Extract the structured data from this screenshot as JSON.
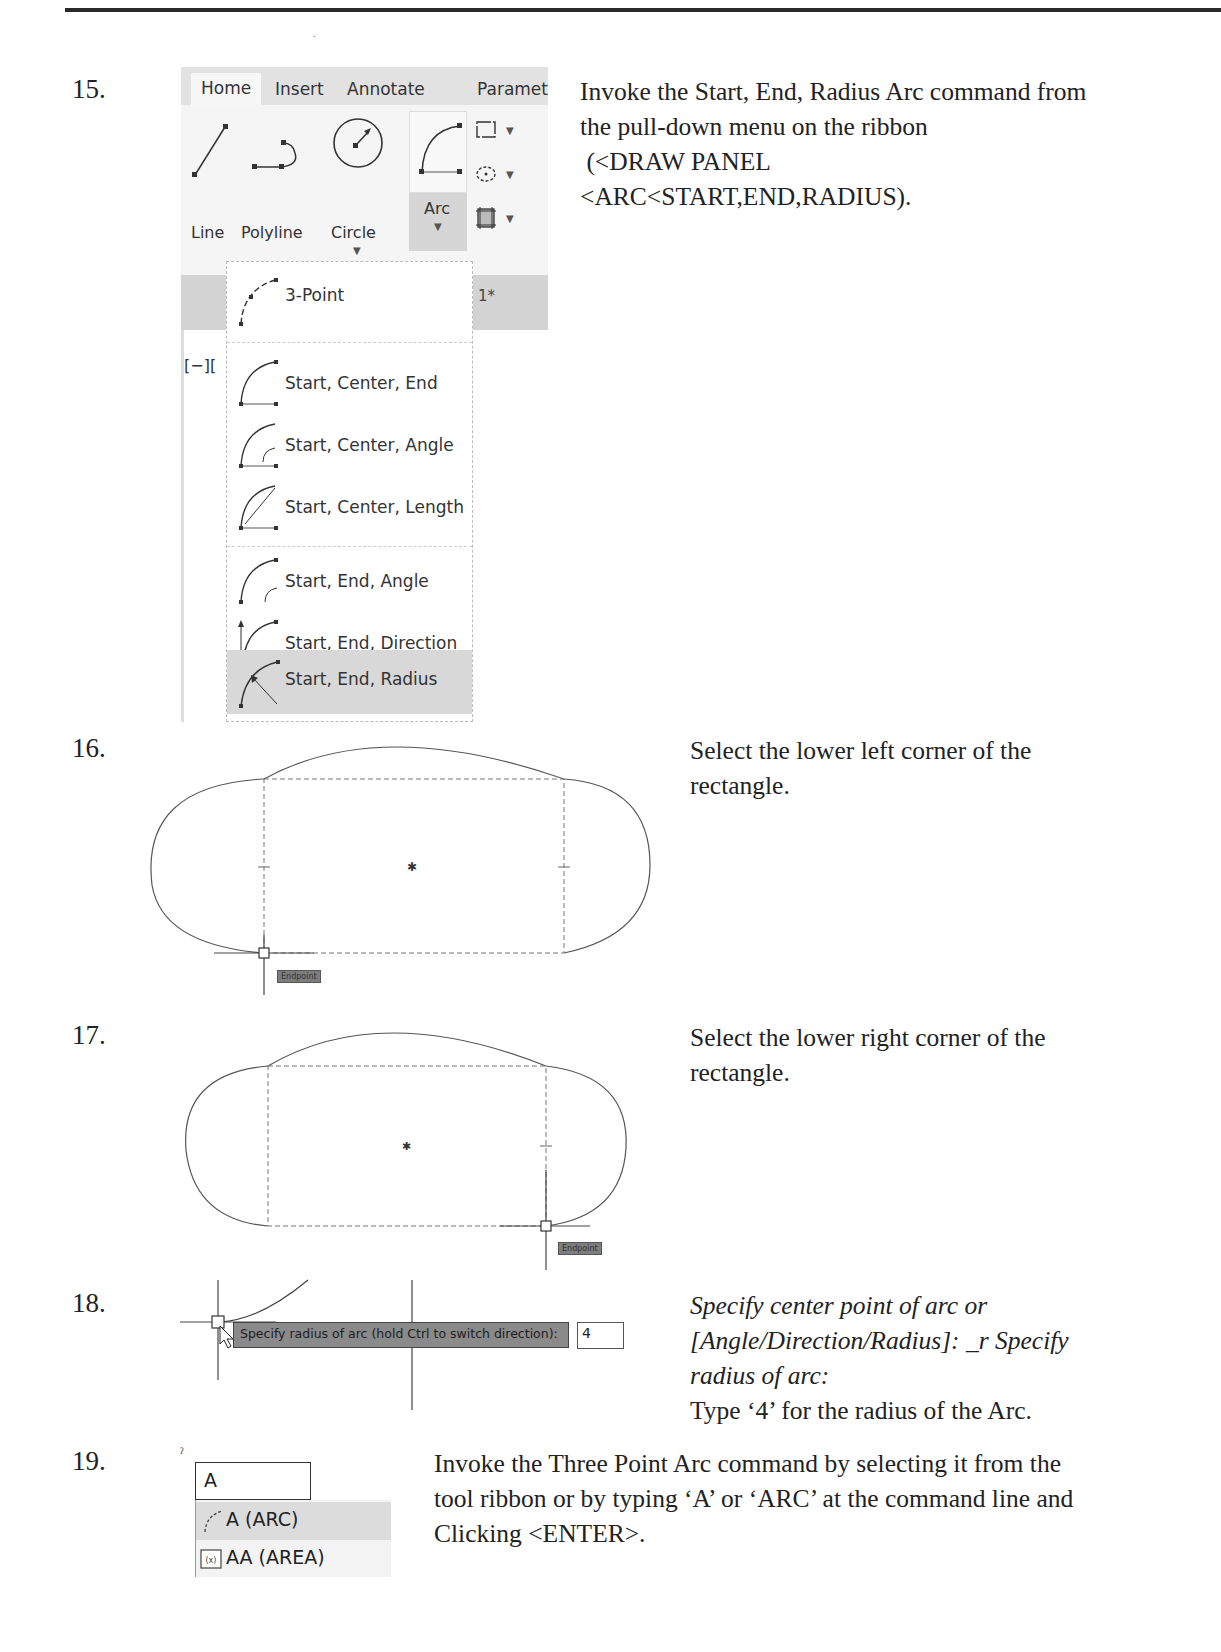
{
  "page": {
    "header_rule": true,
    "stray_mark": "."
  },
  "steps": [
    {
      "number": "15.",
      "text_lines": [
        "Invoke the Start, End, Radius Arc command from",
        "the pull-down menu on the ribbon",
        " (<DRAW PANEL",
        "<ARC<START,END,RADIUS)."
      ],
      "ribbon": {
        "tabs": [
          {
            "label": "Home",
            "active": true
          },
          {
            "label": "Insert",
            "active": false
          },
          {
            "label": "Annotate",
            "active": false
          },
          {
            "label": "Paramet",
            "active": false
          }
        ],
        "tools": [
          {
            "label": "Line",
            "icon": "line-icon"
          },
          {
            "label": "Polyline",
            "icon": "polyline-icon"
          },
          {
            "label": "Circle",
            "icon": "circle-icon",
            "has_dropdown": true
          },
          {
            "label": "Arc",
            "icon": "arc-icon",
            "has_dropdown": true,
            "pressed": true
          }
        ],
        "small_tools": [
          {
            "icon": "rectangle-icon"
          },
          {
            "icon": "ellipse-icon"
          },
          {
            "icon": "hatch-icon"
          }
        ],
        "background_text": {
          "tab_suffix": "1*",
          "viewport_label": "[−]["
        },
        "arc_menu": [
          {
            "label": "3-Point",
            "group": 1
          },
          {
            "label": "Start, Center, End",
            "group": 2
          },
          {
            "label": "Start, Center, Angle",
            "group": 2
          },
          {
            "label": "Start, Center, Length",
            "group": 2
          },
          {
            "label": "Start, End, Angle",
            "group": 3
          },
          {
            "label": "Start, End, Direction",
            "group": 3
          },
          {
            "label": "Start, End, Radius",
            "group": 3,
            "highlighted": true
          }
        ]
      }
    },
    {
      "number": "16.",
      "text_lines": [
        "Select the lower left corner of the",
        "rectangle."
      ],
      "drawing": {
        "snap_tooltip": "Endpoint",
        "snap_corner": "lower-left"
      }
    },
    {
      "number": "17.",
      "text_lines": [
        "Select the lower right corner of the",
        "rectangle."
      ],
      "drawing": {
        "snap_tooltip": "Endpoint",
        "snap_corner": "lower-right"
      }
    },
    {
      "number": "18.",
      "italic_lines": [
        "Specify center point of arc or",
        "[Angle/Direction/Radius]: _r Specify",
        "radius of arc:"
      ],
      "text_lines": [
        "Type ‘4’ for the radius of the Arc."
      ],
      "drawing": {
        "prompt": "Specify radius of arc (hold Ctrl to switch direction):",
        "input_value": "4"
      }
    },
    {
      "number": "19.",
      "text_lines": [
        "Invoke the Three Point Arc command by selecting it from the",
        "tool ribbon or by typing ‘A’ or ‘ARC’ at the command line and",
        "Clicking <ENTER>."
      ],
      "command_line": {
        "input_value": "A",
        "suggestions": [
          {
            "label": "A (ARC)",
            "icon": "arc-3point-icon",
            "highlighted": true
          },
          {
            "label": "AA (AREA)",
            "icon": "area-icon",
            "highlighted": false
          }
        ]
      }
    }
  ]
}
